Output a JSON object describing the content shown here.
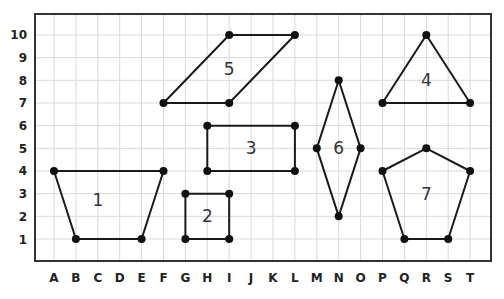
{
  "diagram": {
    "type": "coordinate-grid-shapes",
    "x_labels": [
      "A",
      "B",
      "C",
      "D",
      "E",
      "F",
      "G",
      "H",
      "I",
      "J",
      "K",
      "L",
      "M",
      "N",
      "O",
      "P",
      "Q",
      "R",
      "S",
      "T"
    ],
    "y_labels": [
      "1",
      "2",
      "3",
      "4",
      "5",
      "6",
      "7",
      "8",
      "9",
      "10"
    ],
    "colors": {
      "grid": "#d9d9d9",
      "border": "#333333",
      "shape_stroke": "#1a1a1a",
      "vertex": "#111111",
      "label": "#222222"
    },
    "shapes": [
      {
        "id": "1",
        "name": "trapezoid",
        "label": "1",
        "vertices": [
          "A4",
          "F4",
          "E1",
          "B1"
        ],
        "label_pos": "C2.7"
      },
      {
        "id": "2",
        "name": "square",
        "label": "2",
        "vertices": [
          "G3",
          "I3",
          "I1",
          "G1"
        ],
        "label_pos": "H2"
      },
      {
        "id": "3",
        "name": "rectangle",
        "label": "3",
        "vertices": [
          "H6",
          "L6",
          "L4",
          "H4"
        ],
        "label_pos": "J5"
      },
      {
        "id": "4",
        "name": "triangle",
        "label": "4",
        "vertices": [
          "R10",
          "T7",
          "P7"
        ],
        "label_pos": "R8"
      },
      {
        "id": "5",
        "name": "parallelogram",
        "label": "5",
        "vertices": [
          "I10",
          "L10",
          "I7",
          "F7"
        ],
        "label_pos": "I8.5"
      },
      {
        "id": "6",
        "name": "rhombus",
        "label": "6",
        "vertices": [
          "N8",
          "O5",
          "N2",
          "M5"
        ],
        "label_pos": "N5"
      },
      {
        "id": "7",
        "name": "pentagon",
        "label": "7",
        "vertices": [
          "R5",
          "T4",
          "S1",
          "Q1",
          "P4"
        ],
        "label_pos": "R3"
      }
    ]
  }
}
